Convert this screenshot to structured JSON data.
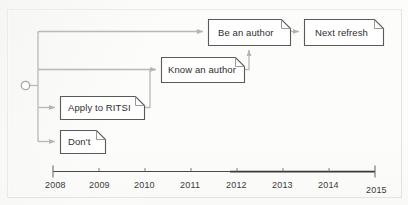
{
  "diagram": {
    "start_node": {
      "name": "start-circle",
      "shape": "hollow-circle"
    },
    "nodes": [
      {
        "id": "be-an-author",
        "label": "Be an author",
        "x": 208,
        "y": 19,
        "w": 82,
        "h": 26
      },
      {
        "id": "next-refresh",
        "label": "Next refresh",
        "x": 304,
        "y": 19,
        "w": 79,
        "h": 26
      },
      {
        "id": "know-an-author",
        "label": "Know an author",
        "x": 161,
        "y": 57,
        "w": 83,
        "h": 25
      },
      {
        "id": "apply-to-ritsi",
        "label": "Apply to RITSI",
        "x": 60,
        "y": 96,
        "w": 84,
        "h": 23
      },
      {
        "id": "dont",
        "label": "Don't",
        "x": 60,
        "y": 130,
        "w": 45,
        "h": 23
      }
    ],
    "edges": [
      {
        "from": "start",
        "to": "be-an-author",
        "name": "edge-start-to-be-an-author"
      },
      {
        "from": "start",
        "to": "know-an-author",
        "name": "edge-start-to-know-an-author"
      },
      {
        "from": "start",
        "to": "apply-to-ritsi",
        "name": "edge-start-to-apply-to-ritsi"
      },
      {
        "from": "start",
        "to": "dont",
        "name": "edge-start-to-dont"
      },
      {
        "from": "be-an-author",
        "to": "next-refresh",
        "name": "edge-be-an-author-to-next-refresh"
      },
      {
        "from": "know-an-author",
        "to": "be-an-author",
        "name": "edge-know-an-author-to-be-an-author"
      },
      {
        "from": "apply-to-ritsi",
        "to": "know-an-author",
        "name": "edge-apply-to-ritsi-to-know-an-author"
      }
    ],
    "colors": {
      "connector": "#b8b8b6",
      "node_border": "#5a5a58",
      "node_fill": "#ffffff",
      "text": "#2e2e2e",
      "axis": "#3d3d3b",
      "paper": "#fcfcfb"
    }
  },
  "chart_data": {
    "type": "timeline",
    "title": "",
    "xlabel": "",
    "ylabel": "",
    "axis_ticks": [
      "2008",
      "2009",
      "2010",
      "2011",
      "2012",
      "2013",
      "2014",
      "2015"
    ],
    "xlim": [
      2008,
      2015
    ],
    "grid": false,
    "legend": "none",
    "events": [
      {
        "label": "Apply to RITSI",
        "year": 2008.1
      },
      {
        "label": "Don't",
        "year": 2008.1
      },
      {
        "label": "Know an author",
        "year": 2010.5
      },
      {
        "label": "Be an author",
        "year": 2011.6
      },
      {
        "label": "Next refresh",
        "year": 2013.6
      }
    ]
  },
  "axis": {
    "ticks": [
      {
        "label": "2008",
        "x": 53,
        "lx": 45
      },
      {
        "label": "2009",
        "x": 99,
        "lx": 89
      },
      {
        "label": "2010",
        "x": 145,
        "lx": 134
      },
      {
        "label": "2011",
        "x": 191,
        "lx": 180
      },
      {
        "label": "2012",
        "x": 237,
        "lx": 226
      },
      {
        "label": "2013",
        "x": 283,
        "lx": 272
      },
      {
        "label": "2014",
        "x": 329,
        "lx": 318
      },
      {
        "label": "2015",
        "x": 375,
        "lx": 366
      }
    ]
  }
}
